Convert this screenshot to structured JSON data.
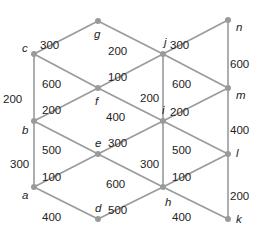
{
  "diagram": {
    "type": "weighted-graph",
    "nodes": [
      {
        "id": "a",
        "x": 34,
        "y": 187
      },
      {
        "id": "b",
        "x": 34,
        "y": 121
      },
      {
        "id": "c",
        "x": 34,
        "y": 54
      },
      {
        "id": "d",
        "x": 98,
        "y": 219
      },
      {
        "id": "e",
        "x": 98,
        "y": 154
      },
      {
        "id": "f",
        "x": 98,
        "y": 88
      },
      {
        "id": "g",
        "x": 98,
        "y": 21
      },
      {
        "id": "h",
        "x": 163,
        "y": 187
      },
      {
        "id": "i",
        "x": 163,
        "y": 121
      },
      {
        "id": "j",
        "x": 163,
        "y": 54
      },
      {
        "id": "k",
        "x": 228,
        "y": 219
      },
      {
        "id": "l",
        "x": 228,
        "y": 154
      },
      {
        "id": "m",
        "x": 228,
        "y": 88
      },
      {
        "id": "n",
        "x": 228,
        "y": 20
      }
    ],
    "edges": [
      {
        "from": "c",
        "to": "g",
        "weight": "300"
      },
      {
        "from": "g",
        "to": "j",
        "weight": "200"
      },
      {
        "from": "j",
        "to": "n",
        "weight": "300"
      },
      {
        "from": "c",
        "to": "f",
        "weight": "600"
      },
      {
        "from": "f",
        "to": "j",
        "weight": "100"
      },
      {
        "from": "j",
        "to": "m",
        "weight": "600"
      },
      {
        "from": "c",
        "to": "b",
        "weight": "200"
      },
      {
        "from": "j",
        "to": "i",
        "weight": "200"
      },
      {
        "from": "n",
        "to": "m",
        "weight": "600"
      },
      {
        "from": "b",
        "to": "f",
        "weight": "200"
      },
      {
        "from": "f",
        "to": "i",
        "weight": "400"
      },
      {
        "from": "i",
        "to": "m",
        "weight": "200"
      },
      {
        "from": "b",
        "to": "e",
        "weight": "500"
      },
      {
        "from": "e",
        "to": "i",
        "weight": "300"
      },
      {
        "from": "i",
        "to": "l",
        "weight": "500"
      },
      {
        "from": "b",
        "to": "a",
        "weight": "300"
      },
      {
        "from": "i",
        "to": "h",
        "weight": "300"
      },
      {
        "from": "m",
        "to": "l",
        "weight": "400"
      },
      {
        "from": "a",
        "to": "e",
        "weight": "100"
      },
      {
        "from": "e",
        "to": "h",
        "weight": "600"
      },
      {
        "from": "h",
        "to": "l",
        "weight": "100"
      },
      {
        "from": "a",
        "to": "d",
        "weight": "400"
      },
      {
        "from": "d",
        "to": "h",
        "weight": "500"
      },
      {
        "from": "h",
        "to": "k",
        "weight": "400"
      },
      {
        "from": "l",
        "to": "k",
        "weight": "200"
      }
    ],
    "node_labels": {
      "a": {
        "text": "a",
        "x": 22,
        "y": 199
      },
      "b": {
        "text": "b",
        "x": 22,
        "y": 134
      },
      "c": {
        "text": "c",
        "x": 22,
        "y": 52
      },
      "d": {
        "text": "d",
        "x": 95,
        "y": 212
      },
      "e": {
        "text": "e",
        "x": 95,
        "y": 147
      },
      "f": {
        "text": "f",
        "x": 95,
        "y": 105
      },
      "g": {
        "text": "g",
        "x": 94,
        "y": 38
      },
      "h": {
        "text": "h",
        "x": 165,
        "y": 206
      },
      "i": {
        "text": "i",
        "x": 162,
        "y": 114
      },
      "j": {
        "text": "j",
        "x": 164,
        "y": 46
      },
      "k": {
        "text": "k",
        "x": 236,
        "y": 223
      },
      "l": {
        "text": "l",
        "x": 236,
        "y": 157
      },
      "m": {
        "text": "m",
        "x": 236,
        "y": 99
      },
      "n": {
        "text": "n",
        "x": 236,
        "y": 31
      }
    },
    "weight_labels": [
      {
        "text": "300",
        "x": 40,
        "y": 40
      },
      {
        "text": "200",
        "x": 108,
        "y": 46
      },
      {
        "text": "300",
        "x": 170,
        "y": 40
      },
      {
        "text": "600",
        "x": 42,
        "y": 79
      },
      {
        "text": "100",
        "x": 108,
        "y": 72
      },
      {
        "text": "600",
        "x": 172,
        "y": 79
      },
      {
        "text": "200",
        "x": 3,
        "y": 94
      },
      {
        "text": "200",
        "x": 140,
        "y": 93
      },
      {
        "text": "600",
        "x": 230,
        "y": 59
      },
      {
        "text": "200",
        "x": 42,
        "y": 105
      },
      {
        "text": "400",
        "x": 106,
        "y": 112
      },
      {
        "text": "200",
        "x": 170,
        "y": 107
      },
      {
        "text": "500",
        "x": 42,
        "y": 145
      },
      {
        "text": "300",
        "x": 108,
        "y": 138
      },
      {
        "text": "500",
        "x": 172,
        "y": 145
      },
      {
        "text": "300",
        "x": 10,
        "y": 159
      },
      {
        "text": "300",
        "x": 140,
        "y": 159
      },
      {
        "text": "400",
        "x": 230,
        "y": 125
      },
      {
        "text": "100",
        "x": 42,
        "y": 172
      },
      {
        "text": "600",
        "x": 106,
        "y": 179
      },
      {
        "text": "100",
        "x": 172,
        "y": 172
      },
      {
        "text": "400",
        "x": 42,
        "y": 212
      },
      {
        "text": "500",
        "x": 108,
        "y": 205
      },
      {
        "text": "400",
        "x": 172,
        "y": 212
      },
      {
        "text": "200",
        "x": 230,
        "y": 191
      }
    ]
  }
}
